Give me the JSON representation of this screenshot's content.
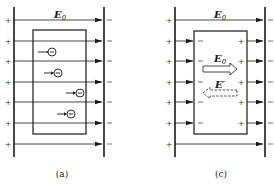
{
  "panels": [
    {
      "id": "a",
      "caption": "(a)",
      "field_label": "E",
      "field_subscript": "0",
      "plus_sign": "+",
      "minus_sign": "−",
      "field_line_count": 7,
      "electron_symbol": "⊖",
      "electrons": 4
    },
    {
      "id": "c",
      "caption": "(c)",
      "field_label": "E",
      "field_subscript": "0",
      "inner_applied_label": "E",
      "inner_applied_subscript": "0",
      "inner_induced_label": "E′",
      "plus_sign": "+",
      "minus_sign": "−",
      "field_line_count": 7
    }
  ],
  "colors": {
    "line": "#1a1a1a",
    "background": "#ffffff"
  }
}
